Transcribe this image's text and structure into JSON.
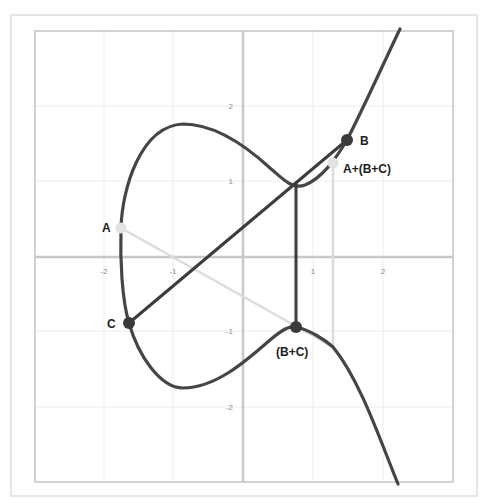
{
  "diagram": {
    "title": "",
    "colors": {
      "background": "#ffffff",
      "outer_frame": "#d6d6d6",
      "inner_frame": "#c4c4c4",
      "grid": "#ececec",
      "axis": "#c8c8c8",
      "curve": "#454545",
      "dark_line": "#3c3c3c",
      "light_line": "#dcdcdc",
      "dark_point": "#3a3a3a",
      "light_point": "#e2e2e2",
      "tick_text": "#8a8a8a",
      "label_text": "#1e1e1e"
    },
    "frames": {
      "outer": {
        "x": 11,
        "y": 15,
        "w": 466,
        "h": 481
      },
      "inner": {
        "x": 35,
        "y": 31,
        "w": 418,
        "h": 451
      }
    },
    "axes": {
      "origin_px": {
        "x": 243,
        "y": 257
      },
      "unit_px": {
        "x": 70,
        "y": 75.5
      },
      "x_ticks": [
        {
          "value": -2,
          "label": "-2",
          "px": 104
        },
        {
          "value": -1,
          "label": "-1",
          "px": 173
        },
        {
          "value": 1,
          "label": "1",
          "px": 313
        },
        {
          "value": 2,
          "label": "2",
          "px": 383
        }
      ],
      "y_ticks": [
        {
          "value": 2,
          "label": "2",
          "px": 106
        },
        {
          "value": 1,
          "label": "1",
          "px": 181
        },
        {
          "value": -1,
          "label": "-1",
          "px": 331
        },
        {
          "value": -2,
          "label": "-2",
          "px": 407
        }
      ],
      "extra_vgrid_px": [
        313,
        383,
        104,
        173
      ],
      "extra_hgrid_px": [
        106,
        181,
        331,
        407
      ]
    },
    "curve": {
      "name": "elliptic-curve",
      "path": "M400,29 C385,60 365,105 347,140 C335,160 322,178 305,185 C292,190 282,178 270,168 C245,145 215,124 183,124 C140,126 122,190 121,228 C120,260 122,300 129,323 C138,355 160,388 183,388 C215,388 245,362 270,340 C282,330 290,325 296,327 C310,330 325,340 333,347 C360,380 380,440 398,484"
    },
    "lines": [
      {
        "name": "line-c-to-b",
        "style": "dark",
        "x1": 129,
        "y1": 323,
        "x2": 347,
        "y2": 140
      },
      {
        "name": "vertical-reflection-b-plus-c",
        "style": "dark",
        "x1": 296,
        "y1": 183,
        "x2": 296,
        "y2": 327
      },
      {
        "name": "line-a-to-b-plus-c",
        "style": "light",
        "x1": 121,
        "y1": 228,
        "x2": 333,
        "y2": 347
      },
      {
        "name": "vertical-reflection-result",
        "style": "light",
        "x1": 333,
        "y1": 163,
        "x2": 333,
        "y2": 347
      }
    ],
    "points": [
      {
        "name": "point-a",
        "label": "A",
        "style": "light",
        "x": 121,
        "y": 228,
        "label_x": 102,
        "label_y": 232,
        "anchor": "start"
      },
      {
        "name": "point-b",
        "label": "B",
        "style": "dark",
        "x": 347,
        "y": 140,
        "label_x": 360,
        "label_y": 145,
        "anchor": "start"
      },
      {
        "name": "point-c",
        "label": "C",
        "style": "dark",
        "x": 129,
        "y": 323,
        "label_x": 107,
        "label_y": 328,
        "anchor": "start"
      },
      {
        "name": "point-b-plus-c",
        "label": "(B+C)",
        "style": "dark",
        "x": 296,
        "y": 327,
        "label_x": 276,
        "label_y": 356,
        "anchor": "start"
      },
      {
        "name": "point-a-plus-b-plus-c",
        "label": "A+(B+C)",
        "style": "light",
        "x": 333,
        "y": 163,
        "label_x": 343,
        "label_y": 173,
        "anchor": "start"
      }
    ]
  }
}
